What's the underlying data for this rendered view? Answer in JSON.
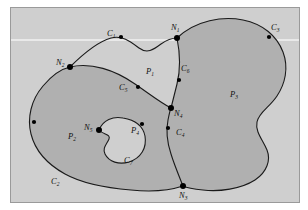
{
  "figure": {
    "type": "topology-region-diagram",
    "caption": "",
    "background_color": "#cfcfcf",
    "shaded_region_color": "#b0b0b0",
    "open_region_color": "#cfcfcf",
    "curve_color": "#1a1a1a",
    "node_color": "#000000"
  },
  "regions": [
    {
      "id": "P1",
      "base": "P",
      "sub": "1",
      "shaded": false,
      "description": "upper middle open lens region between the two outlines"
    },
    {
      "id": "P2",
      "base": "P",
      "sub": "2",
      "shaded": true,
      "description": "large left shaded region containing a hole"
    },
    {
      "id": "P3",
      "base": "P",
      "sub": "3",
      "shaded": true,
      "description": "large right shaded region"
    },
    {
      "id": "P4",
      "base": "P",
      "sub": "4",
      "shaded": false,
      "description": "inner hole inside P2"
    }
  ],
  "curves": [
    {
      "id": "C1",
      "base": "C",
      "sub": "1",
      "description": "upper arc from N2 to N1"
    },
    {
      "id": "C2",
      "base": "C",
      "sub": "2",
      "description": "lower left outer boundary of P2"
    },
    {
      "id": "C3",
      "base": "C",
      "sub": "3",
      "description": "upper right outer boundary of P3"
    },
    {
      "id": "C4",
      "base": "C",
      "sub": "4",
      "description": "arc from N4 down toward N3"
    },
    {
      "id": "C5",
      "base": "C",
      "sub": "5",
      "description": "arc from N2 to N4 separating P1 and P2"
    },
    {
      "id": "C6",
      "base": "C",
      "sub": "6",
      "description": "arc from N1 down to N4 separating P1 and P3"
    },
    {
      "id": "C7",
      "base": "C",
      "sub": "7",
      "description": "boundary of the inner hole P4"
    }
  ],
  "nodes": [
    {
      "id": "N1",
      "base": "N",
      "sub": "1",
      "description": "top intersection node"
    },
    {
      "id": "N2",
      "base": "N",
      "sub": "2",
      "description": "left intersection node"
    },
    {
      "id": "N3",
      "base": "N",
      "sub": "3",
      "description": "bottom intersection node"
    },
    {
      "id": "N4",
      "base": "N",
      "sub": "4",
      "description": "center intersection node"
    },
    {
      "id": "N5",
      "base": "N",
      "sub": "5",
      "description": "node on the inner hole boundary"
    }
  ],
  "labels": {
    "C1": {
      "base": "C",
      "sub": "1",
      "x": 96,
      "y": 28
    },
    "C2": {
      "base": "C",
      "sub": "2",
      "x": 40,
      "y": 176
    },
    "C3": {
      "base": "C",
      "sub": "3",
      "x": 260,
      "y": 22
    },
    "C4": {
      "base": "C",
      "sub": "4",
      "x": 165,
      "y": 127
    },
    "C5": {
      "base": "C",
      "sub": "5",
      "x": 108,
      "y": 82
    },
    "C6": {
      "base": "C",
      "sub": "6",
      "x": 170,
      "y": 63
    },
    "C7": {
      "base": "C",
      "sub": "7",
      "x": 113,
      "y": 155
    },
    "P1": {
      "base": "P",
      "sub": "1",
      "x": 135,
      "y": 66
    },
    "P2": {
      "base": "P",
      "sub": "2",
      "x": 57,
      "y": 131
    },
    "P3": {
      "base": "P",
      "sub": "3",
      "x": 219,
      "y": 89
    },
    "P4": {
      "base": "P",
      "sub": "4",
      "x": 120,
      "y": 125
    },
    "N1": {
      "base": "N",
      "sub": "1",
      "x": 166,
      "y": 22
    },
    "N2": {
      "base": "N",
      "sub": "2",
      "x": 59,
      "y": 59
    },
    "N3": {
      "base": "N",
      "sub": "3",
      "x": 173,
      "y": 185
    },
    "N4": {
      "base": "N",
      "sub": "4",
      "x": 159,
      "y": 105
    },
    "N5": {
      "base": "N",
      "sub": "5",
      "x": 83,
      "y": 122
    }
  }
}
